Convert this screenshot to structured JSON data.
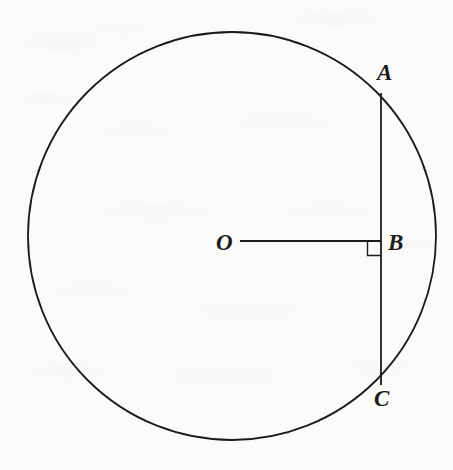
{
  "figure": {
    "type": "geometry-diagram",
    "background_color": "#fbfbf9",
    "stroke_color": "#1b1b1b",
    "canvas": {
      "width": 453,
      "height": 470
    }
  },
  "circle": {
    "name": "circle-O",
    "center": {
      "x": 232,
      "y": 236
    },
    "radius": 204,
    "stroke_width": 1.8
  },
  "segments": [
    {
      "name": "chord-AC",
      "label": "AC",
      "from": {
        "x": 381,
        "y": 93
      },
      "to": {
        "x": 381,
        "y": 385
      },
      "stroke_width": 1.8,
      "orientation": "vertical"
    },
    {
      "name": "radius-OB",
      "label": "OB",
      "from": {
        "x": 240,
        "y": 241
      },
      "to": {
        "x": 381,
        "y": 241
      },
      "stroke_width": 1.8,
      "orientation": "horizontal"
    }
  ],
  "right_angle": {
    "name": "right-angle-mark-at-B",
    "vertex": {
      "x": 381,
      "y": 241
    },
    "size": 14,
    "opens": "down-left",
    "stroke_width": 1.4
  },
  "labels": [
    {
      "id": "A",
      "text": "A",
      "name": "point-label-a",
      "x": 377,
      "y": 61,
      "describes": "chord endpoint on circle, upper right"
    },
    {
      "id": "B",
      "text": "B",
      "name": "point-label-b",
      "x": 388,
      "y": 231,
      "describes": "foot of perpendicular from center to chord"
    },
    {
      "id": "C",
      "text": "C",
      "name": "point-label-c",
      "x": 374,
      "y": 387,
      "describes": "chord endpoint on circle, lower right"
    },
    {
      "id": "O",
      "text": "O",
      "name": "point-label-o",
      "x": 216,
      "y": 231,
      "describes": "center of the circle"
    }
  ]
}
